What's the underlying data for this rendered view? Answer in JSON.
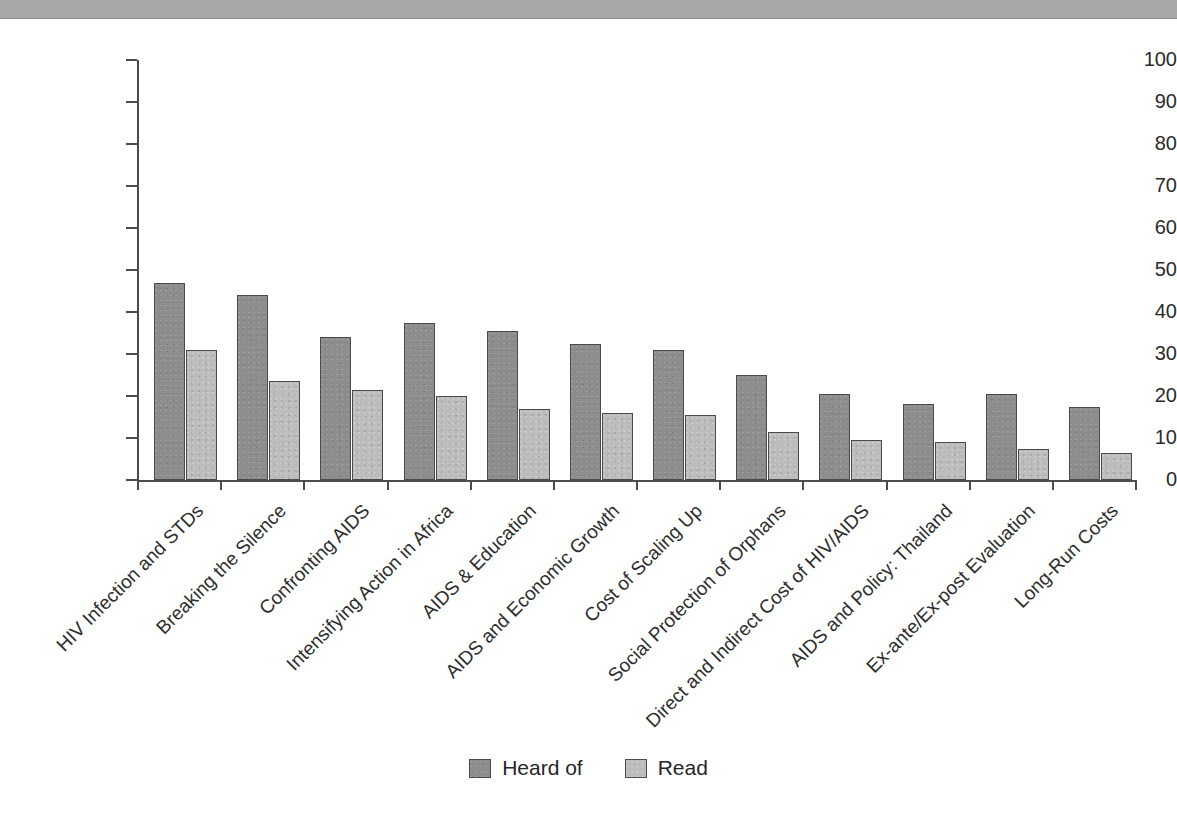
{
  "decoration": {
    "top_band_color": "#a8a8a8"
  },
  "colors": {
    "heard_of": "#8d8d8d",
    "read": "#bcbcbc",
    "axis": "#4c4c4c",
    "text": "#2d2d2d"
  },
  "legend": {
    "position": "bottom-center",
    "items": [
      {
        "label": "Heard of",
        "color": "#8d8d8d",
        "swatch": "dark-gray-swatch"
      },
      {
        "label": "Read",
        "color": "#bcbcbc",
        "swatch": "light-gray-swatch"
      }
    ]
  },
  "axis": {
    "y_ticks": [
      "0",
      "10",
      "20",
      "30",
      "40",
      "50",
      "60",
      "70",
      "80",
      "90",
      "100"
    ]
  },
  "chart_data": {
    "type": "bar",
    "title": "",
    "subtitle": "",
    "xlabel": "",
    "ylabel": "",
    "ylim": [
      0,
      100
    ],
    "ytick_interval": 10,
    "grid": false,
    "legend_position": "bottom-center",
    "orientation": "vertical",
    "grouping": "grouped",
    "categories": [
      "HIV Infection and STDs",
      "Breaking the Silence",
      "Confronting AIDS",
      "Intensifying Action in Africa",
      "AIDS & Education",
      "AIDS and Economic Growth",
      "Cost of Scaling Up",
      "Social Protection of Orphans",
      "Direct and Indirect Cost of HIV/AIDS",
      "AIDS and Policy: Thailand",
      "Ex-ante/Ex-post Evaluation",
      "Long-Run Costs"
    ],
    "series": [
      {
        "name": "Heard of",
        "color": "#8d8d8d",
        "values": [
          47,
          44,
          34,
          37.5,
          35.5,
          32.5,
          31,
          25,
          20.5,
          18,
          20.5,
          17.5
        ]
      },
      {
        "name": "Read",
        "color": "#bcbcbc",
        "values": [
          31,
          23.5,
          21.5,
          20,
          17,
          16,
          15.5,
          11.5,
          9.5,
          9,
          7.5,
          6.5
        ]
      }
    ]
  }
}
